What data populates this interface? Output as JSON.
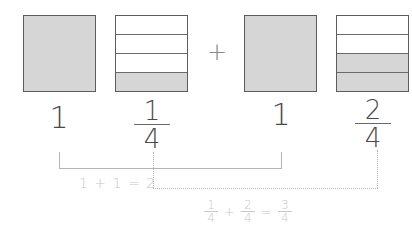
{
  "diagram": {
    "colors": {
      "shaded": "#d6d6d6",
      "border": "#5c5c5c",
      "text": "#4a4a4a",
      "connector": "#b4b4b4",
      "caption": "#c8c8c8"
    },
    "squares": [
      {
        "id": "sq1",
        "type": "whole",
        "parts": 1,
        "shaded": 1
      },
      {
        "id": "sq2",
        "type": "fraction",
        "parts": 4,
        "shaded": 1
      },
      {
        "id": "sq3",
        "type": "whole",
        "parts": 1,
        "shaded": 1
      },
      {
        "id": "sq4",
        "type": "fraction",
        "parts": 4,
        "shaded": 2
      }
    ],
    "operator": "+",
    "labels": {
      "whole1": "1",
      "frac2": {
        "numerator": "1",
        "denominator": "4"
      },
      "whole3": "1",
      "frac4": {
        "numerator": "2",
        "denominator": "4"
      }
    },
    "captions": {
      "wholes_sum": "1 + 1 = 2",
      "fractions_sum": {
        "a": {
          "numerator": "1",
          "denominator": "4"
        },
        "plus": "+",
        "b": {
          "numerator": "2",
          "denominator": "4"
        },
        "equals": "=",
        "result": {
          "numerator": "3",
          "denominator": "4"
        }
      }
    }
  }
}
